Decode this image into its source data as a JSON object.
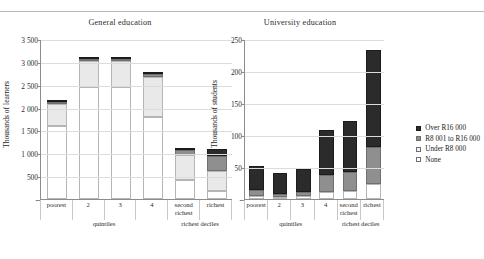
{
  "chart_data": [
    {
      "type": "bar",
      "title": "General education",
      "ylabel": "Thousands of learners",
      "xlabel": "",
      "ylim": [
        0,
        3500
      ],
      "yticks": [
        0,
        500,
        1000,
        1500,
        2000,
        2500,
        3000,
        3500
      ],
      "ytick_labels": [
        "-",
        "500",
        "1 000",
        "1 500",
        "2 000",
        "2 500",
        "3 000",
        "3 500"
      ],
      "grid": true,
      "stacked": true,
      "categories": [
        "poorest",
        "2",
        "3",
        "4",
        "second richest",
        "richest"
      ],
      "groups": [
        {
          "label": "quintiles",
          "span": 4
        },
        {
          "label": "richest deciles",
          "span": 2
        }
      ],
      "series": [
        {
          "name": "None",
          "values": [
            1630,
            2490,
            2480,
            1815,
            415,
            185
          ]
        },
        {
          "name": "Under R8 000",
          "values": [
            490,
            590,
            575,
            885,
            565,
            430
          ]
        },
        {
          "name": "R8 001 to R16 000",
          "values": [
            45,
            30,
            40,
            70,
            95,
            330
          ]
        },
        {
          "name": "Over R16 000",
          "values": [
            5,
            5,
            5,
            10,
            35,
            145
          ]
        }
      ],
      "totals": [
        2170,
        3115,
        3100,
        2780,
        1110,
        1090
      ]
    },
    {
      "type": "bar",
      "title": "University education",
      "ylabel": "Thousands of students",
      "xlabel": "",
      "ylim": [
        0,
        250
      ],
      "yticks": [
        0,
        50,
        100,
        150,
        200,
        250
      ],
      "ytick_labels": [
        "-",
        "50",
        "100",
        "150",
        "200",
        "250"
      ],
      "grid": true,
      "stacked": true,
      "categories": [
        "poorest",
        "2",
        "3",
        "4",
        "second richest",
        "richest"
      ],
      "groups": [
        {
          "label": "quintiles",
          "span": 4
        },
        {
          "label": "richest deciles",
          "span": 2
        }
      ],
      "series": [
        {
          "name": "None",
          "values": [
            5,
            3,
            4,
            11,
            12,
            24
          ]
        },
        {
          "name": "R8 001 to R16 000",
          "values": [
            9,
            5,
            7,
            27,
            31,
            58
          ]
        },
        {
          "name": "Over R16 000",
          "values": [
            37,
            33,
            36,
            70,
            79,
            151
          ]
        }
      ],
      "totals": [
        51,
        41,
        47,
        108,
        122,
        233
      ]
    }
  ],
  "legend": {
    "position": "right",
    "items": [
      {
        "label": "Over R16 000",
        "swatch": "over",
        "color": "#2b2b2b"
      },
      {
        "label": "R8 001 to R16 000",
        "swatch": "mid",
        "color": "#8f8f8f"
      },
      {
        "label": "Under R8 000",
        "swatch": "under",
        "color": "#f2f2f2"
      },
      {
        "label": "None",
        "swatch": "none",
        "color": "#ffffff"
      }
    ]
  }
}
